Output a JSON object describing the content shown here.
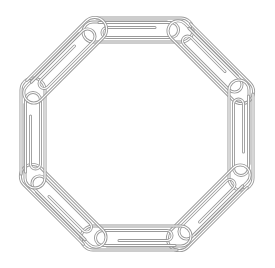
{
  "illustration": {
    "subject": "paperclip-chain-octagon",
    "clip_count": 8,
    "stroke_color": "#9a9a9a",
    "inner_stroke_color": "#b5b5b5",
    "background": "#ffffff",
    "center": [
      137,
      134
    ],
    "radius": 104,
    "clips": [
      {
        "angle": 0
      },
      {
        "angle": 45
      },
      {
        "angle": 90
      },
      {
        "angle": 135
      },
      {
        "angle": 180
      },
      {
        "angle": 225
      },
      {
        "angle": 270
      },
      {
        "angle": 315
      }
    ]
  }
}
